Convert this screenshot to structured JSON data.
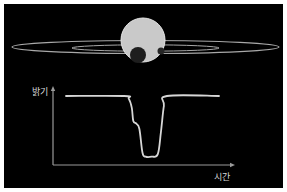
{
  "colors": {
    "background": "#000000",
    "border": "#ffffff",
    "star": "#c9c9c9",
    "star_edge": "#e6e6e6",
    "planet_large": "#1e1e1e",
    "planet_small": "#262626",
    "ring": "#a8a8a8",
    "curve": "#d6d6d6",
    "axis": "#9a9a9a",
    "label": "#d8d8d8"
  },
  "scene": {
    "star": {
      "name": "star"
    },
    "planets": [
      {
        "name": "large-planet"
      },
      {
        "name": "small-planet"
      }
    ],
    "rings": [
      {
        "name": "outer-orbit-ring"
      },
      {
        "name": "inner-orbit-ring"
      }
    ]
  },
  "chart_data": {
    "type": "line",
    "title": "",
    "xlabel": "시간",
    "ylabel": "밝기",
    "x_ticks": [],
    "y_ticks": [],
    "grid": false,
    "legend": "none",
    "xlim": [
      0,
      1
    ],
    "ylim": [
      0,
      1.15
    ],
    "series": [
      {
        "name": "light-curve",
        "x": [
          0.0,
          0.38,
          0.41,
          0.43,
          0.44,
          0.46,
          0.48,
          0.5,
          0.52,
          0.56,
          0.6,
          0.62,
          0.64,
          0.66,
          1.0
        ],
        "y": [
          1.0,
          1.0,
          0.96,
          0.82,
          0.62,
          0.58,
          0.5,
          0.14,
          0.08,
          0.08,
          0.12,
          0.45,
          0.85,
          1.0,
          1.0
        ]
      }
    ]
  }
}
